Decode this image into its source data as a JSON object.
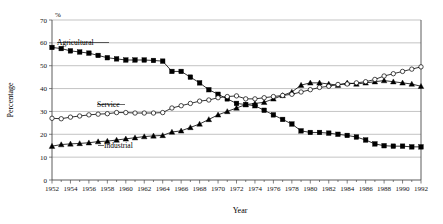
{
  "chart_data": {
    "type": "line",
    "title": "",
    "xlabel": "Year",
    "ylabel": "Percentage",
    "unit_label": "%",
    "ylim": [
      0,
      70
    ],
    "xlim": [
      1952,
      1992
    ],
    "y_ticks": [
      0,
      10,
      20,
      30,
      40,
      50,
      60,
      70
    ],
    "x_ticks": [
      1952,
      1954,
      1956,
      1958,
      1960,
      1962,
      1964,
      1966,
      1968,
      1970,
      1972,
      1974,
      1976,
      1978,
      1980,
      1982,
      1984,
      1986,
      1988,
      1990,
      1992
    ],
    "grid": "horizontal",
    "legend_position": "inline-labels",
    "x": [
      1952,
      1953,
      1954,
      1955,
      1956,
      1957,
      1958,
      1959,
      1960,
      1961,
      1962,
      1963,
      1964,
      1965,
      1966,
      1967,
      1968,
      1969,
      1970,
      1971,
      1972,
      1973,
      1974,
      1975,
      1976,
      1977,
      1978,
      1979,
      1980,
      1981,
      1982,
      1983,
      1984,
      1985,
      1986,
      1987,
      1988,
      1989,
      1990,
      1991,
      1992
    ],
    "series": [
      {
        "name": "Agricultural",
        "marker": "filled-square",
        "values": [
          58.0,
          57.5,
          56.5,
          56.0,
          55.5,
          54.5,
          53.5,
          53.0,
          52.5,
          52.5,
          52.5,
          52.3,
          52.0,
          47.5,
          47.5,
          45.0,
          42.5,
          39.5,
          37.5,
          35.5,
          33.5,
          33.0,
          32.5,
          30.5,
          28.5,
          26.5,
          24.5,
          21.5,
          20.8,
          20.8,
          20.5,
          20.0,
          19.5,
          18.8,
          17.5,
          15.8,
          15.0,
          14.8,
          14.8,
          14.5,
          14.5
        ]
      },
      {
        "name": "Industrial",
        "marker": "filled-triangle",
        "values": [
          14.8,
          15.5,
          15.8,
          16.0,
          16.3,
          16.8,
          17.0,
          17.5,
          18.0,
          18.5,
          19.0,
          19.3,
          19.5,
          21.0,
          21.5,
          23.0,
          24.5,
          26.5,
          28.5,
          30.0,
          31.5,
          33.0,
          33.5,
          34.0,
          35.5,
          37.0,
          38.5,
          41.5,
          42.5,
          42.5,
          42.0,
          41.5,
          42.5,
          42.0,
          42.5,
          43.0,
          43.5,
          43.0,
          42.5,
          42.0,
          41.0
        ]
      },
      {
        "name": "Service",
        "marker": "open-circle",
        "values": [
          27.0,
          26.8,
          27.5,
          28.0,
          28.5,
          28.8,
          29.0,
          29.5,
          29.5,
          29.3,
          29.3,
          29.3,
          29.5,
          31.5,
          32.5,
          33.5,
          34.5,
          35.0,
          36.0,
          36.5,
          36.8,
          35.5,
          35.5,
          36.0,
          36.5,
          37.0,
          37.5,
          38.5,
          39.5,
          40.5,
          41.0,
          41.8,
          42.0,
          42.5,
          43.0,
          44.0,
          45.5,
          46.5,
          47.5,
          48.5,
          49.5
        ]
      }
    ]
  },
  "annotations": {
    "agricultural_label": "Agricultural",
    "industrial_label": "Industrial",
    "service_label": "Service"
  }
}
